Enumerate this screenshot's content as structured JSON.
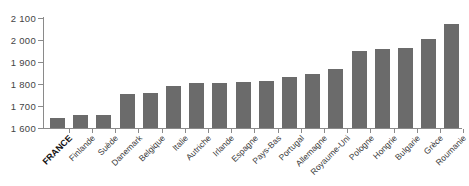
{
  "chart_data": {
    "type": "bar",
    "title": "",
    "subtitle": "",
    "xlabel": "",
    "ylabel": "",
    "ylim": [
      1600,
      2100
    ],
    "ytick_step": 100,
    "yticks": [
      1600,
      1700,
      1800,
      1900,
      2000,
      2100
    ],
    "ytick_labels": [
      "1 600",
      "1 700",
      "1 800",
      "1 900",
      "2 000",
      "2 100"
    ],
    "grid": false,
    "legend": null,
    "bar_color": "#6b6b6b",
    "axis_color": "#8a8a8a",
    "highlight_category": "FRANCE",
    "categories": [
      "FRANCE",
      "Finlande",
      "Suède",
      "Danemark",
      "Belgique",
      "Italie",
      "Autriche",
      "Irlande",
      "Espagne",
      "Pays-Bas",
      "Portugal",
      "Allemagne",
      "Royaume-Uni",
      "Pologne",
      "Hongrie",
      "Bulgarie",
      "Grèce",
      "Roumanie"
    ],
    "values": [
      1645,
      1660,
      1660,
      1755,
      1760,
      1790,
      1805,
      1805,
      1810,
      1815,
      1830,
      1845,
      1870,
      1950,
      1960,
      1965,
      2005,
      2075
    ]
  }
}
